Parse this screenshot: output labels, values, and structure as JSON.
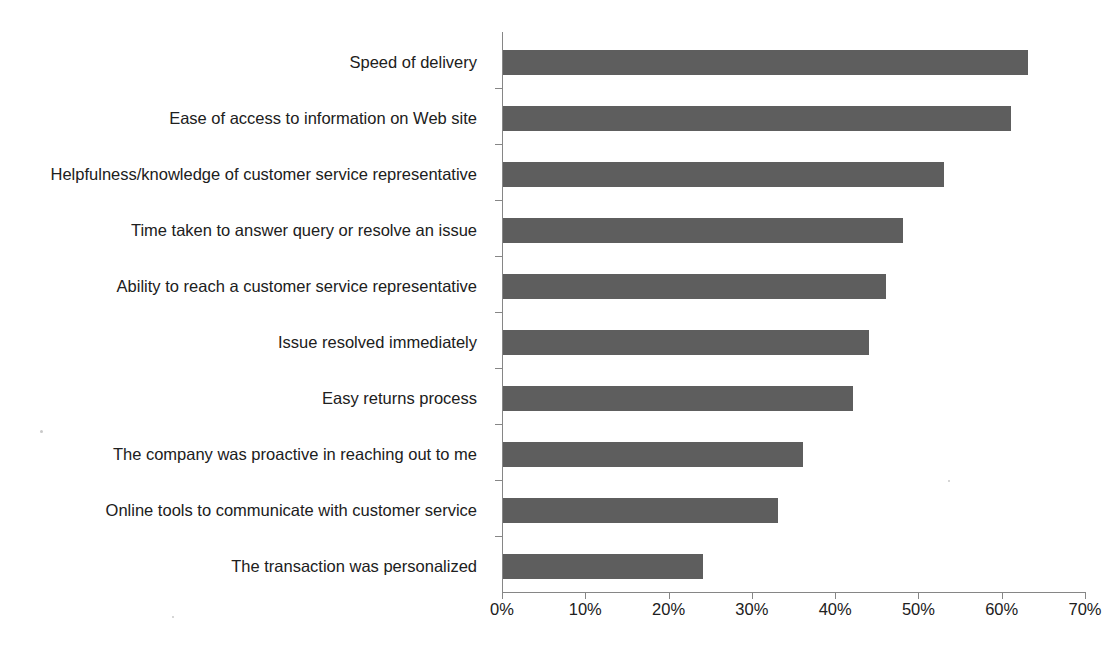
{
  "chart_data": {
    "type": "bar",
    "orientation": "horizontal",
    "title": "",
    "subtitle": "",
    "xlabel": "",
    "ylabel": "",
    "xlim": [
      0,
      70
    ],
    "xtick_labels": [
      "0%",
      "10%",
      "20%",
      "30%",
      "40%",
      "50%",
      "60%",
      "70%"
    ],
    "xticks": [
      0,
      10,
      20,
      30,
      40,
      50,
      60,
      70
    ],
    "grid": false,
    "legend": false,
    "value_suffix": "%",
    "bar_color": "#5e5e5e",
    "axis_color": "#868686",
    "background_color": "#ffffff",
    "categories": [
      "Speed of delivery",
      "Ease of access to information on Web site",
      "Helpfulness/knowledge of customer service representative",
      "Time taken to answer query or resolve an issue",
      "Ability to reach a customer service representative",
      "Issue resolved immediately",
      "Easy returns process",
      "The company was proactive in reaching out to me",
      "Online tools to communicate with customer service",
      "The transaction was personalized"
    ],
    "values": [
      63,
      61,
      53,
      48,
      46,
      44,
      42,
      36,
      33,
      24
    ]
  }
}
